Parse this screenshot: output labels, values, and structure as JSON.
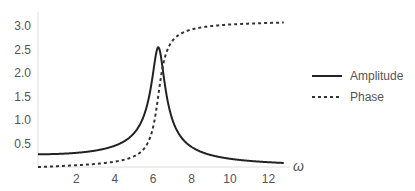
{
  "chart_data": {
    "type": "line",
    "title": "",
    "xlabel": "ω",
    "ylabel": "",
    "xlim": [
      0,
      12.8
    ],
    "ylim": [
      0,
      3.2
    ],
    "x_ticks": [
      2,
      4,
      6,
      8,
      10,
      12
    ],
    "x_tick_labels": [
      "2",
      "4",
      "6",
      "8",
      "10",
      "12"
    ],
    "y_ticks": [
      0.5,
      1.0,
      1.5,
      2.0,
      2.5,
      3.0
    ],
    "y_tick_labels": [
      "0.5",
      "1.0",
      "1.5",
      "2.0",
      "2.5",
      "3.0"
    ],
    "grid": false,
    "legend_position": "right",
    "model": {
      "omega0": 6.283,
      "gamma": 0.67,
      "force": 10.7
    },
    "series": [
      {
        "name": "Amplitude",
        "style": "solid",
        "color": "#222222",
        "x": [
          0,
          1,
          2,
          3,
          4,
          5,
          5.5,
          6,
          6.2,
          6.3,
          6.4,
          6.6,
          7,
          7.5,
          8,
          9,
          10,
          11,
          12,
          12.8
        ],
        "values": [
          0.27,
          0.28,
          0.3,
          0.35,
          0.46,
          0.74,
          1.07,
          1.94,
          2.45,
          2.53,
          2.34,
          1.71,
          0.99,
          0.62,
          0.44,
          0.26,
          0.18,
          0.13,
          0.1,
          0.086
        ]
      },
      {
        "name": "Phase",
        "style": "dashed",
        "color": "#222222",
        "x": [
          0,
          1,
          2,
          3,
          4,
          5,
          5.5,
          6,
          6.3,
          6.6,
          7,
          7.5,
          8,
          9,
          10,
          11,
          12,
          12.8
        ],
        "values": [
          0.0,
          0.02,
          0.04,
          0.07,
          0.11,
          0.23,
          0.38,
          0.8,
          1.6,
          2.29,
          2.64,
          2.84,
          2.93,
          3.0,
          3.04,
          3.06,
          3.08,
          3.07
        ]
      }
    ]
  },
  "legend": {
    "items": [
      {
        "label": "Amplitude",
        "style": "solid"
      },
      {
        "label": "Phase",
        "style": "dashed"
      }
    ]
  },
  "axis": {
    "x_label": "ω"
  }
}
